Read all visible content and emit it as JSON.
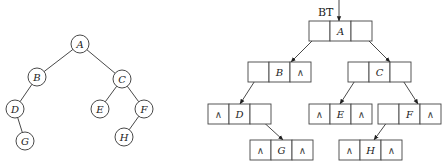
{
  "tree": {
    "nodes": [
      {
        "id": "A",
        "label": "A",
        "cx": 80,
        "cy": 44
      },
      {
        "id": "B",
        "label": "B",
        "cx": 37,
        "cy": 77
      },
      {
        "id": "C",
        "label": "C",
        "cx": 122,
        "cy": 79
      },
      {
        "id": "D",
        "label": "D",
        "cx": 15,
        "cy": 109
      },
      {
        "id": "E",
        "label": "E",
        "cx": 100,
        "cy": 109
      },
      {
        "id": "F",
        "label": "F",
        "cx": 144,
        "cy": 109
      },
      {
        "id": "G",
        "label": "G",
        "cx": 25,
        "cy": 141
      },
      {
        "id": "H",
        "label": "H",
        "cx": 124,
        "cy": 137
      }
    ],
    "edges": [
      [
        "A",
        "B"
      ],
      [
        "A",
        "C"
      ],
      [
        "B",
        "D"
      ],
      [
        "D",
        "G"
      ],
      [
        "C",
        "E"
      ],
      [
        "C",
        "F"
      ],
      [
        "F",
        "H"
      ]
    ],
    "radius": 9
  },
  "linked": {
    "root_pointer_label": "BT",
    "null_symbol": "∧",
    "nodes": [
      {
        "id": "A",
        "data": "A",
        "x": 309,
        "y": 21,
        "left": "ptr",
        "right": "ptr"
      },
      {
        "id": "B",
        "data": "B",
        "x": 248,
        "y": 62,
        "left": "ptr",
        "right": "null"
      },
      {
        "id": "C",
        "data": "C",
        "x": 348,
        "y": 62,
        "left": "ptr",
        "right": "ptr"
      },
      {
        "id": "D",
        "data": "D",
        "x": 208,
        "y": 104,
        "left": "null",
        "right": "ptr"
      },
      {
        "id": "E",
        "data": "E",
        "x": 309,
        "y": 104,
        "left": "null",
        "right": "null"
      },
      {
        "id": "F",
        "data": "F",
        "x": 378,
        "y": 104,
        "left": "ptr",
        "right": "null"
      },
      {
        "id": "G",
        "data": "G",
        "x": 250,
        "y": 140,
        "left": "null",
        "right": "null"
      },
      {
        "id": "H",
        "data": "H",
        "x": 339,
        "y": 140,
        "left": "null",
        "right": "null"
      }
    ],
    "arrows": [
      {
        "from": "BT",
        "x1": 339,
        "y1": 0,
        "x2": 339,
        "y2": 21
      },
      {
        "from": "A.left",
        "x1": 320,
        "y1": 33,
        "x2": 291,
        "y2": 62
      },
      {
        "from": "A.right",
        "x1": 361,
        "y1": 33,
        "x2": 390,
        "y2": 62
      },
      {
        "from": "B.left",
        "x1": 258,
        "y1": 76,
        "x2": 240,
        "y2": 104
      },
      {
        "from": "C.left",
        "x1": 358,
        "y1": 76,
        "x2": 340,
        "y2": 104
      },
      {
        "from": "C.right",
        "x1": 400,
        "y1": 76,
        "x2": 418,
        "y2": 104
      },
      {
        "from": "D.right",
        "x1": 259,
        "y1": 118,
        "x2": 283,
        "y2": 140
      },
      {
        "from": "F.left",
        "x1": 390,
        "y1": 118,
        "x2": 374,
        "y2": 140
      }
    ],
    "cell_width": 21,
    "cell_height": 20
  }
}
